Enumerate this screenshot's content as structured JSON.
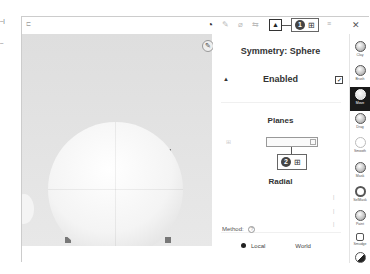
{
  "margin_marks": [
    "–|",
    "–"
  ],
  "topbar": {
    "menu_icon": "⊏",
    "toolbar_icons": [
      {
        "name": "wedge-circle-icon",
        "glyph": "◔"
      },
      {
        "name": "pen-icon",
        "glyph": "✎"
      },
      {
        "name": "pipette-icon",
        "glyph": "⌀"
      },
      {
        "name": "arrows-icon",
        "glyph": "⇆"
      }
    ],
    "symmetry_button_glyph": "▲",
    "callout1": {
      "number": "1",
      "glyph": "⊞"
    },
    "sliders_glyph": "≡",
    "close_glyph": "✕"
  },
  "viewport": {
    "pin_glyph": "✎"
  },
  "panel": {
    "title": "Symmetry: Sphere",
    "enabled_label": "Enabled",
    "enabled_checked": "✓",
    "enabled_icon": "▲",
    "planes_label": "Planes",
    "plane_icon": "⊞",
    "callout2": {
      "number": "2",
      "glyph": "⊞"
    },
    "radial_label": "Radial",
    "method_label": "Method:",
    "method_help": "?",
    "method_options": [
      "Local",
      "World"
    ],
    "method_selected": "Local"
  },
  "sidebar": {
    "tools": [
      {
        "label": "Clay",
        "active": false
      },
      {
        "label": "Brush",
        "active": false
      },
      {
        "label": "Move",
        "active": true
      },
      {
        "label": "Drag",
        "active": false
      },
      {
        "label": "Smooth",
        "active": false
      },
      {
        "label": "Mask",
        "active": false
      },
      {
        "label": "SelMask",
        "active": false
      },
      {
        "label": "Paint",
        "active": false
      },
      {
        "label": "Smudge",
        "active": false
      }
    ]
  }
}
